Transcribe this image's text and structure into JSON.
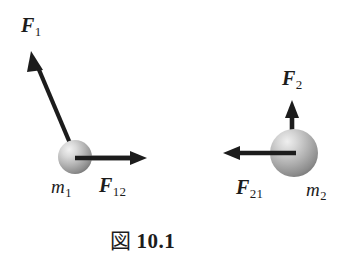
{
  "figure": {
    "caption_kanji": "図",
    "caption_number": "10.1",
    "background_color": "#ffffff",
    "stroke_color": "#1c1c1c",
    "sphere_light_color": "#e0e0e0",
    "sphere_mid_color": "#b4b4b4",
    "sphere_dark_color": "#7d7d7d"
  },
  "labels": {
    "f1": {
      "symbol": "F",
      "subscript": "1"
    },
    "f12": {
      "symbol": "F",
      "subscript": "12"
    },
    "f2": {
      "symbol": "F",
      "subscript": "2"
    },
    "f21": {
      "symbol": "F",
      "subscript": "21"
    },
    "m1": {
      "symbol": "m",
      "subscript": "1"
    },
    "m2": {
      "symbol": "m",
      "subscript": "2"
    }
  },
  "bodies": [
    {
      "name": "mass-1",
      "cx": 75,
      "cy": 157,
      "r": 17
    },
    {
      "name": "mass-2",
      "cx": 294,
      "cy": 153,
      "r": 24
    }
  ],
  "vectors": [
    {
      "name": "F1",
      "from": [
        72,
        148
      ],
      "to": [
        31,
        51
      ],
      "label": "f1"
    },
    {
      "name": "F12",
      "from": [
        74,
        158
      ],
      "to": [
        147,
        158
      ],
      "label": "f12"
    },
    {
      "name": "F2",
      "from": [
        292,
        136
      ],
      "to": [
        292,
        100
      ],
      "label": "f2"
    },
    {
      "name": "F21",
      "from": [
        296,
        153
      ],
      "to": [
        223,
        153
      ],
      "label": "f21"
    }
  ]
}
